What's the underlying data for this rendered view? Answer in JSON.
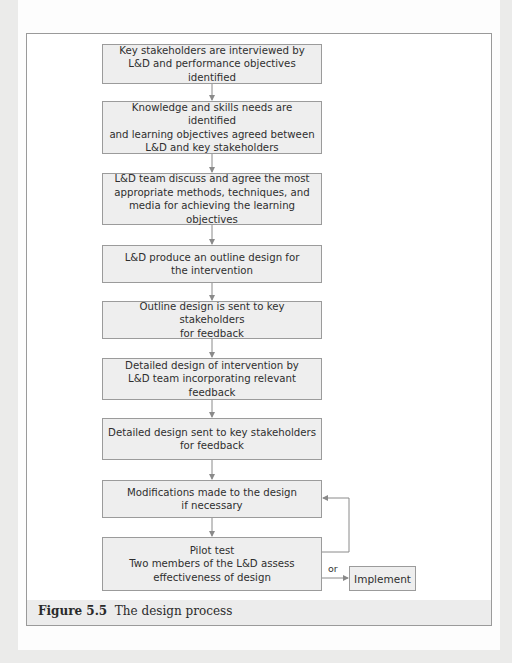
{
  "figure": {
    "caption_label": "Figure 5.5",
    "caption_text": "The design process"
  },
  "flow": {
    "steps": [
      {
        "id": 1,
        "text": "Key stakeholders are interviewed by\nL&D and performance objectives identified"
      },
      {
        "id": 2,
        "text": "Knowledge and skills needs are identified\nand learning objectives agreed between\nL&D and key stakeholders"
      },
      {
        "id": 3,
        "text": "L&D team discuss and agree the most\nappropriate methods, techniques, and\nmedia for achieving the learning objectives"
      },
      {
        "id": 4,
        "text": "L&D produce an outline design for\nthe intervention"
      },
      {
        "id": 5,
        "text": "Outline design is sent to key stakeholders\nfor feedback"
      },
      {
        "id": 6,
        "text": "Detailed design of intervention by\nL&D team incorporating relevant feedback"
      },
      {
        "id": 7,
        "text": "Detailed design sent to key stakeholders\nfor feedback"
      },
      {
        "id": 8,
        "text": "Modifications made to the design\nif necessary"
      },
      {
        "id": 9,
        "text": "Pilot test\nTwo members of the L&D assess\neffectiveness of design"
      }
    ],
    "branch_label": "or",
    "end_step": "Implement",
    "loop": {
      "from": 9,
      "to": 8
    }
  },
  "colors": {
    "box_fill": "#eeeeee",
    "box_border": "#9b9b9b",
    "arrow": "#8a8a8a",
    "caption_band": "#ececec",
    "page_margin": "#ebebea"
  }
}
